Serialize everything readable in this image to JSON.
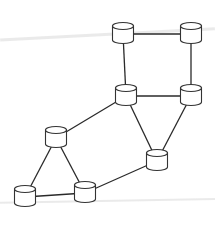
{
  "diagram": {
    "type": "network-topology",
    "node_shape": "cylinder",
    "colors": {
      "stroke": "#333333",
      "fill": "#ffffff",
      "background": "#ffffff"
    },
    "nodes": [
      {
        "id": "n1",
        "x": 123,
        "y": 34
      },
      {
        "id": "n2",
        "x": 191,
        "y": 34
      },
      {
        "id": "n3",
        "x": 126,
        "y": 96
      },
      {
        "id": "n4",
        "x": 191,
        "y": 96
      },
      {
        "id": "n5",
        "x": 56,
        "y": 138
      },
      {
        "id": "n6",
        "x": 157,
        "y": 161
      },
      {
        "id": "n7",
        "x": 25,
        "y": 197
      },
      {
        "id": "n8",
        "x": 85,
        "y": 193
      }
    ],
    "edges": [
      [
        "n1",
        "n2"
      ],
      [
        "n1",
        "n3"
      ],
      [
        "n2",
        "n4"
      ],
      [
        "n3",
        "n4"
      ],
      [
        "n3",
        "n5"
      ],
      [
        "n3",
        "n6"
      ],
      [
        "n4",
        "n6"
      ],
      [
        "n5",
        "n7"
      ],
      [
        "n5",
        "n8"
      ],
      [
        "n7",
        "n8"
      ],
      [
        "n8",
        "n6"
      ]
    ]
  }
}
